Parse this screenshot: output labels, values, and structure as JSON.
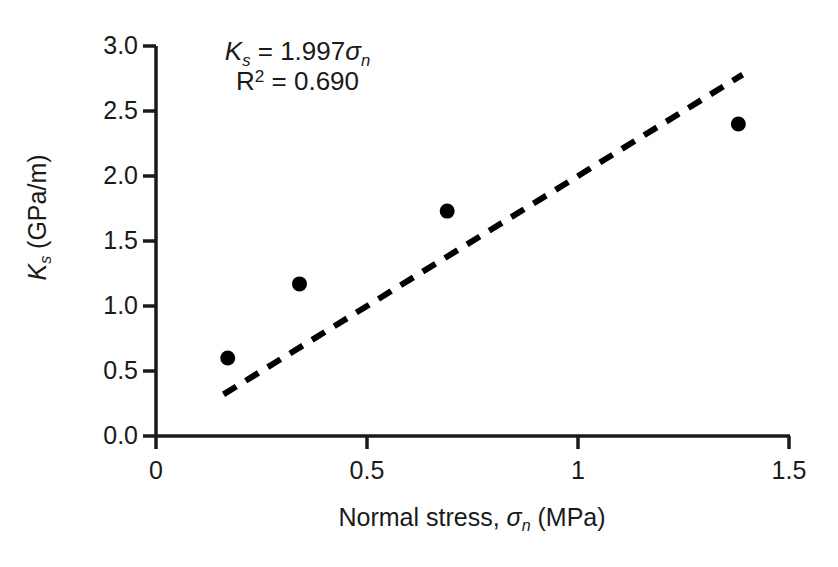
{
  "chart_data": {
    "type": "scatter",
    "title": "",
    "xlabel": "Normal stress, σn (MPa)",
    "ylabel": "Ks (GPa/m)",
    "xlim": [
      0,
      1.5
    ],
    "ylim": [
      0,
      3.0
    ],
    "xticks": [
      "0",
      "0.5",
      "1",
      "1.5"
    ],
    "xtick_values": [
      0,
      0.5,
      1,
      1.5
    ],
    "yticks": [
      "0.0",
      "0.5",
      "1.0",
      "1.5",
      "2.0",
      "2.5",
      "3.0"
    ],
    "ytick_values": [
      0,
      0.5,
      1.0,
      1.5,
      2.0,
      2.5,
      3.0
    ],
    "grid": false,
    "legend": false,
    "marker_color": "#000000",
    "marker_shape": "circle",
    "trendline_style": "dashed",
    "trendline_color": "#000000",
    "x": [
      0.17,
      0.34,
      0.69,
      1.38
    ],
    "y": [
      0.6,
      1.17,
      1.73,
      2.4
    ],
    "points": [
      {
        "x": 0.17,
        "y": 0.6
      },
      {
        "x": 0.34,
        "y": 1.17
      },
      {
        "x": 0.69,
        "y": 1.73
      },
      {
        "x": 1.38,
        "y": 2.4
      }
    ],
    "trendline": {
      "slope": 1.997,
      "intercept": 0,
      "x_start": 0.16,
      "x_end": 1.39,
      "y_start": 0.32,
      "y_end": 2.78
    },
    "annotations": {
      "equation_symbol": "K",
      "equation_subscript": "s",
      "equation_body": " = 1.997",
      "equation_sigma": "σ",
      "equation_sigma_subscript": "n",
      "r_squared_label": "R",
      "r_squared_sup": "2",
      "r_squared_value": " = 0.690"
    }
  },
  "axis_titles": {
    "y_symbol": "K",
    "y_subscript": "s",
    "y_units": " (GPa/m)",
    "x_prefix": "Normal stress, ",
    "x_sigma": "σ",
    "x_sigma_subscript": "n",
    "x_units": " (MPa)"
  },
  "tick_labels": {
    "y": [
      "3.0",
      "2.5",
      "2.0",
      "1.5",
      "1.0",
      "0.5",
      "0.0"
    ],
    "x": [
      "0",
      "0.5",
      "1",
      "1.5"
    ]
  }
}
